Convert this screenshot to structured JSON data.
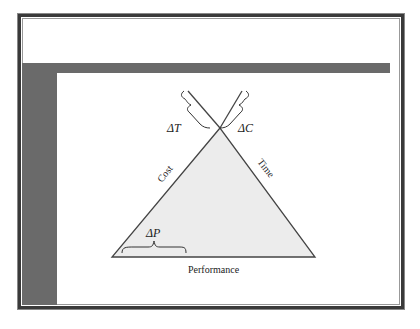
{
  "diagram": {
    "sides": {
      "left": "Cost",
      "right": "Time",
      "bottom": "Performance"
    },
    "deltas": {
      "top_left": "ΔT",
      "top_right": "ΔC",
      "bottom_left": "ΔP"
    },
    "colors": {
      "triangle_fill": "#ececec",
      "frame": "#3a3a3a",
      "accent_bar": "#6a6a6a"
    }
  }
}
